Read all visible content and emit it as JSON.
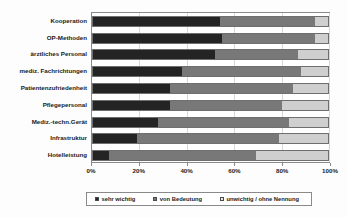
{
  "chart_data": {
    "type": "bar",
    "orientation": "horizontal",
    "stacked": true,
    "stack_mode": "percent",
    "title": "",
    "subtitle": "",
    "xlabel": "",
    "ylabel": "",
    "xlim": [
      0,
      100
    ],
    "xticks": [
      0,
      20,
      40,
      60,
      80,
      100
    ],
    "xticklabels": [
      "0%",
      "20%",
      "40%",
      "60%",
      "80%",
      "100%"
    ],
    "grid": true,
    "legend_position": "bottom",
    "categories": [
      "Kooperation",
      "OP-Methoden",
      "ärztliches Personal",
      "mediz. Fachrichtungen",
      "Patientenzufriedenheit",
      "Pflegepersonal",
      "Mediz.-techn.Gerät",
      "Infrastruktur",
      "Hotelleistung"
    ],
    "series": [
      {
        "name": "sehr wichtig",
        "color": "#242424",
        "values": [
          54,
          55,
          52,
          38,
          33,
          33,
          28,
          19,
          7
        ]
      },
      {
        "name": "von Bedeutung",
        "color": "#787878",
        "values": [
          40,
          39,
          35,
          50,
          52,
          47,
          55,
          60,
          62
        ]
      },
      {
        "name": "unwichtig / ohne Nennung",
        "color": "#cfcfcf",
        "values": [
          6,
          6,
          13,
          12,
          15,
          20,
          17,
          21,
          31
        ]
      }
    ]
  },
  "legend": {
    "items": [
      {
        "label": "sehr wichtig"
      },
      {
        "label": "von Bedeutung"
      },
      {
        "label": "unwichtig / ohne Nennung"
      }
    ]
  }
}
